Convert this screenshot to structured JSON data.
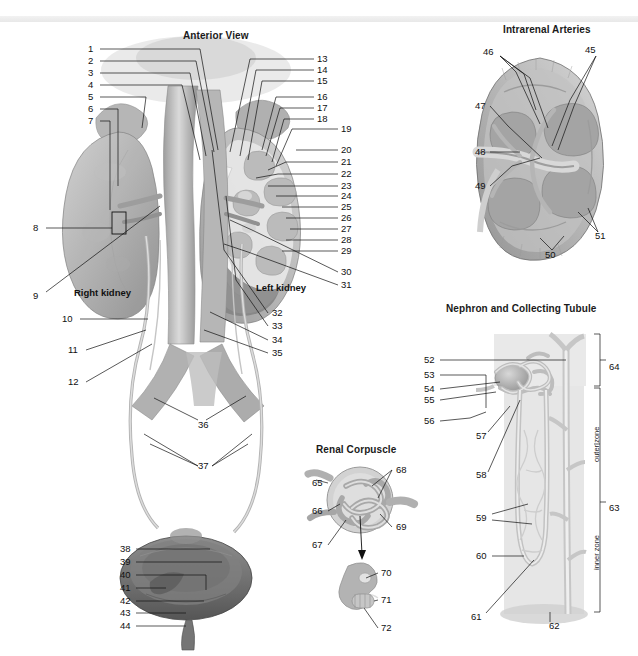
{
  "plate": {
    "background_color": "#ffffff",
    "ink_color": "#111111",
    "style": "grayscale anatomical illustration plate, numbered leader lines"
  },
  "panels": {
    "anterior": {
      "title": "Anterior View",
      "organ_labels": [
        {
          "text": "Right kidney",
          "x": 74,
          "y": 287
        },
        {
          "text": "Left kidney",
          "x": 256,
          "y": 282
        }
      ]
    },
    "intrarenal": {
      "title": "Intrarenal Arteries"
    },
    "nephron": {
      "title": "Nephron and Collecting Tubule",
      "zones": [
        {
          "text": "outer zone",
          "x": 592,
          "y": 462
        },
        {
          "text": "inner zone",
          "x": 592,
          "y": 570
        }
      ]
    },
    "corpuscle": {
      "title": "Renal Corpuscle"
    }
  },
  "numbers": {
    "anterior_left": [
      {
        "n": "1",
        "x": 88,
        "y": 49
      },
      {
        "n": "2",
        "x": 88,
        "y": 61
      },
      {
        "n": "3",
        "x": 88,
        "y": 73
      },
      {
        "n": "4",
        "x": 88,
        "y": 85
      },
      {
        "n": "5",
        "x": 88,
        "y": 97
      },
      {
        "n": "6",
        "x": 88,
        "y": 109
      },
      {
        "n": "7",
        "x": 88,
        "y": 121
      },
      {
        "n": "8",
        "x": 33,
        "y": 228
      },
      {
        "n": "9",
        "x": 33,
        "y": 296
      },
      {
        "n": "10",
        "x": 62,
        "y": 319
      },
      {
        "n": "11",
        "x": 68,
        "y": 350
      },
      {
        "n": "12",
        "x": 68,
        "y": 382
      }
    ],
    "anterior_right": [
      {
        "n": "13",
        "x": 317,
        "y": 59
      },
      {
        "n": "14",
        "x": 317,
        "y": 70
      },
      {
        "n": "15",
        "x": 317,
        "y": 81
      },
      {
        "n": "16",
        "x": 317,
        "y": 97
      },
      {
        "n": "17",
        "x": 317,
        "y": 108
      },
      {
        "n": "18",
        "x": 317,
        "y": 119
      },
      {
        "n": "19",
        "x": 341,
        "y": 129
      },
      {
        "n": "20",
        "x": 341,
        "y": 150
      },
      {
        "n": "21",
        "x": 341,
        "y": 162
      },
      {
        "n": "22",
        "x": 341,
        "y": 174
      },
      {
        "n": "23",
        "x": 341,
        "y": 186
      },
      {
        "n": "24",
        "x": 341,
        "y": 196
      },
      {
        "n": "25",
        "x": 341,
        "y": 207
      },
      {
        "n": "26",
        "x": 341,
        "y": 218
      },
      {
        "n": "27",
        "x": 341,
        "y": 229
      },
      {
        "n": "28",
        "x": 341,
        "y": 240
      },
      {
        "n": "29",
        "x": 341,
        "y": 251
      },
      {
        "n": "30",
        "x": 341,
        "y": 272
      },
      {
        "n": "31",
        "x": 341,
        "y": 285
      }
    ],
    "anterior_mid": [
      {
        "n": "32",
        "x": 272,
        "y": 313
      },
      {
        "n": "33",
        "x": 272,
        "y": 326
      },
      {
        "n": "34",
        "x": 272,
        "y": 340
      },
      {
        "n": "35",
        "x": 272,
        "y": 353
      },
      {
        "n": "36",
        "x": 198,
        "y": 425
      },
      {
        "n": "37",
        "x": 198,
        "y": 466
      }
    ],
    "bladder": [
      {
        "n": "38",
        "x": 120,
        "y": 549
      },
      {
        "n": "39",
        "x": 120,
        "y": 562
      },
      {
        "n": "40",
        "x": 120,
        "y": 575
      },
      {
        "n": "41",
        "x": 120,
        "y": 588
      },
      {
        "n": "42",
        "x": 120,
        "y": 601
      },
      {
        "n": "43",
        "x": 120,
        "y": 613
      },
      {
        "n": "44",
        "x": 120,
        "y": 626
      }
    ],
    "intrarenal": [
      {
        "n": "45",
        "x": 585,
        "y": 50
      },
      {
        "n": "46",
        "x": 483,
        "y": 52
      },
      {
        "n": "47",
        "x": 475,
        "y": 106
      },
      {
        "n": "48",
        "x": 475,
        "y": 152
      },
      {
        "n": "49",
        "x": 475,
        "y": 186
      },
      {
        "n": "50",
        "x": 545,
        "y": 255
      },
      {
        "n": "51",
        "x": 595,
        "y": 236
      }
    ],
    "nephron": [
      {
        "n": "52",
        "x": 424,
        "y": 360
      },
      {
        "n": "53",
        "x": 424,
        "y": 375
      },
      {
        "n": "54",
        "x": 424,
        "y": 389
      },
      {
        "n": "55",
        "x": 424,
        "y": 400
      },
      {
        "n": "56",
        "x": 424,
        "y": 421
      },
      {
        "n": "57",
        "x": 476,
        "y": 436
      },
      {
        "n": "58",
        "x": 476,
        "y": 475
      },
      {
        "n": "59",
        "x": 476,
        "y": 518
      },
      {
        "n": "60",
        "x": 476,
        "y": 556
      },
      {
        "n": "61",
        "x": 471,
        "y": 617
      },
      {
        "n": "62",
        "x": 549,
        "y": 626
      },
      {
        "n": "63",
        "x": 609,
        "y": 508
      },
      {
        "n": "64",
        "x": 609,
        "y": 367
      }
    ],
    "corpuscle": [
      {
        "n": "65",
        "x": 312,
        "y": 483
      },
      {
        "n": "66",
        "x": 312,
        "y": 511
      },
      {
        "n": "67",
        "x": 312,
        "y": 545
      },
      {
        "n": "68",
        "x": 396,
        "y": 470
      },
      {
        "n": "69",
        "x": 396,
        "y": 527
      },
      {
        "n": "70",
        "x": 381,
        "y": 573
      },
      {
        "n": "71",
        "x": 381,
        "y": 600
      },
      {
        "n": "72",
        "x": 381,
        "y": 628
      }
    ]
  }
}
